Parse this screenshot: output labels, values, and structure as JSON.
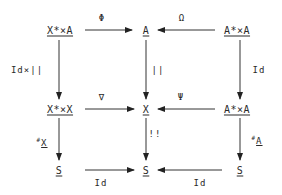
{
  "diagram": {
    "type": "commutative-diagram",
    "nodes": {
      "r1c1": "X*×A",
      "r1c2": "A",
      "r1c3": "A*×A",
      "r2c1": "X*×X",
      "r2c2": "X",
      "r2c3": "A*×A",
      "r3c1": "S",
      "r3c2": "S",
      "r3c3": "S"
    },
    "edges": {
      "r1_left": {
        "label": "Φ",
        "from": "X*×A",
        "to": "A"
      },
      "r1_right": {
        "label": "Ω",
        "from": "A*×A",
        "to": "A"
      },
      "r2_left": {
        "label": "∇",
        "from": "X*×X",
        "to": "X"
      },
      "r2_right": {
        "label": "Ψ",
        "from": "A*×A",
        "to": "X"
      },
      "r3_left": {
        "label": "Id",
        "from": "S",
        "to": "S"
      },
      "r3_right": {
        "label": "Id",
        "from": "S",
        "to": "S"
      },
      "c1_top": {
        "label": "Id×||",
        "from": "X*×A",
        "to": "X*×X"
      },
      "c2_top": {
        "label": "||",
        "from": "A",
        "to": "X"
      },
      "c3_top": {
        "label": "Id",
        "from": "A*×A",
        "to": "A*×A"
      },
      "c1_bottom": {
        "label_prefix": "#",
        "label": "X",
        "from": "X*×X",
        "to": "S"
      },
      "c2_bottom": {
        "label": "!!",
        "from": "X",
        "to": "S"
      },
      "c3_bottom": {
        "label_prefix": "#",
        "label": "A",
        "from": "A*×A",
        "to": "S"
      }
    }
  }
}
